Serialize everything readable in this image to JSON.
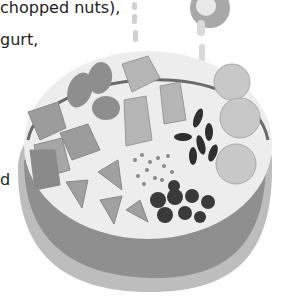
{
  "text": {
    "line1": "chopped nuts),",
    "line2": "gurt,",
    "line3": "d"
  },
  "illustration": {
    "subject": "bowl of mixed ingredients",
    "items": [
      "cheese cubes",
      "pecan/almond halves",
      "wafer pieces",
      "banana slices",
      "black beans",
      "seeds",
      "berry slices",
      "dark berries",
      "milk pour from spoon"
    ],
    "colors": {
      "bowl_outer": "#bdbdbd",
      "bowl_inner_band": "#8f8f8f",
      "bowl_interior": "#ededed",
      "cubes": "#9a9a9a",
      "dark_items": "#3a3a3a",
      "light_items": "#c8c8c8"
    }
  }
}
